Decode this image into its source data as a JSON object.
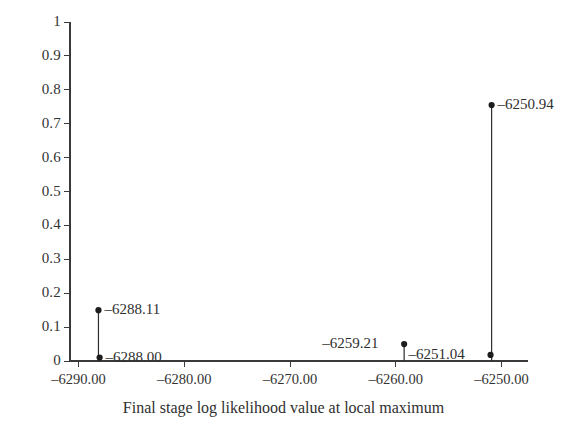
{
  "chart_data": {
    "type": "scatter",
    "title": "",
    "subtitle": "",
    "xlabel": "Final stage log likelihood value at local maximum",
    "ylabel": "",
    "xlim": [
      -6290.8,
      -6247.5
    ],
    "ylim": [
      0,
      1
    ],
    "grid": false,
    "legend": null,
    "x_ticks": [
      {
        "value": -6290,
        "label": "–6290.00"
      },
      {
        "value": -6280,
        "label": "–6280.00"
      },
      {
        "value": -6270,
        "label": "–6270.00"
      },
      {
        "value": -6260,
        "label": "–6260.00"
      },
      {
        "value": -6250,
        "label": "–6250.00"
      }
    ],
    "y_ticks": [
      {
        "value": 0,
        "label": "0"
      },
      {
        "value": 0.1,
        "label": "0.1"
      },
      {
        "value": 0.2,
        "label": "0.2"
      },
      {
        "value": 0.3,
        "label": "0.3"
      },
      {
        "value": 0.4,
        "label": "0.4"
      },
      {
        "value": 0.5,
        "label": "0.5"
      },
      {
        "value": 0.6,
        "label": "0.6"
      },
      {
        "value": 0.7,
        "label": "0.7"
      },
      {
        "value": 0.8,
        "label": "0.8"
      },
      {
        "value": 0.9,
        "label": "0.9"
      },
      {
        "value": 1,
        "label": "1"
      }
    ],
    "points": [
      {
        "name": "point-6288-11",
        "x": -6288.11,
        "y": 0.15,
        "annotation": "–6288.11",
        "annotation_side": "right",
        "stem": true
      },
      {
        "name": "point-6288-00",
        "x": -6288.0,
        "y": 0.01,
        "annotation": "–6288.00",
        "annotation_side": "right",
        "stem": false
      },
      {
        "name": "point-6259-21",
        "x": -6259.21,
        "y": 0.05,
        "annotation": "–6259.21",
        "annotation_side": "left",
        "stem": true
      },
      {
        "name": "point-6250-94",
        "x": -6250.94,
        "y": 0.755,
        "annotation": "–6250.94",
        "annotation_side": "right",
        "stem": true
      },
      {
        "name": "point-6251-04",
        "x": -6251.04,
        "y": 0.018,
        "annotation": "–6251.04",
        "annotation_side": "left",
        "stem": false
      }
    ],
    "colors": {
      "axis": "#3a3a3a",
      "marker": "#1d1d1d",
      "stem": "#2e2e2e",
      "text": "#2f2f2f",
      "background": "#ffffff"
    }
  }
}
